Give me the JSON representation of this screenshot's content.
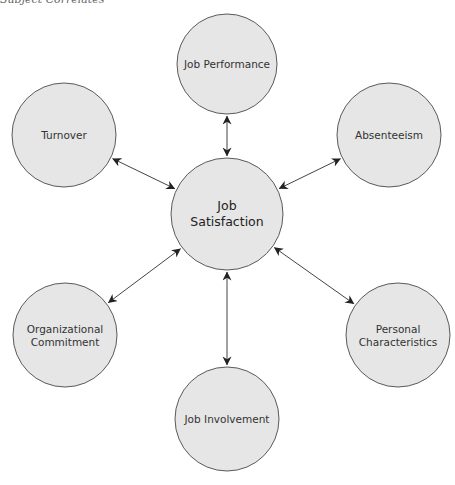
{
  "caption": "Subject Correlates",
  "colors": {
    "node_fill": "#e6e6e6",
    "node_stroke": "#5a5a5a",
    "edge": "#444444",
    "text": "#333333"
  },
  "center": {
    "id": "job-satisfaction",
    "lines": [
      "Job",
      "Satisfaction"
    ],
    "cx": 227,
    "cy": 214,
    "r": 56
  },
  "nodes": [
    {
      "id": "job-performance",
      "lines": [
        "Job Performance"
      ],
      "cx": 227,
      "cy": 64,
      "r": 50
    },
    {
      "id": "turnover",
      "lines": [
        "Turnover"
      ],
      "cx": 64,
      "cy": 135,
      "r": 52
    },
    {
      "id": "absenteeism",
      "lines": [
        "Absenteeism"
      ],
      "cx": 389,
      "cy": 135,
      "r": 52
    },
    {
      "id": "organizational-commitment",
      "lines": [
        "Organizational",
        "Commitment"
      ],
      "cx": 65,
      "cy": 335,
      "r": 52
    },
    {
      "id": "personal-characteristics",
      "lines": [
        "Personal",
        "Characteristics"
      ],
      "cx": 398,
      "cy": 335,
      "r": 52
    },
    {
      "id": "job-involvement",
      "lines": [
        "Job Involvement"
      ],
      "cx": 227,
      "cy": 419,
      "r": 52
    }
  ],
  "edges": [
    {
      "from": "job-satisfaction",
      "to": "job-performance",
      "bidirectional": true
    },
    {
      "from": "job-satisfaction",
      "to": "turnover",
      "bidirectional": true
    },
    {
      "from": "job-satisfaction",
      "to": "absenteeism",
      "bidirectional": true
    },
    {
      "from": "job-satisfaction",
      "to": "organizational-commitment",
      "bidirectional": true
    },
    {
      "from": "job-satisfaction",
      "to": "personal-characteristics",
      "bidirectional": true
    },
    {
      "from": "job-satisfaction",
      "to": "job-involvement",
      "bidirectional": true
    }
  ]
}
